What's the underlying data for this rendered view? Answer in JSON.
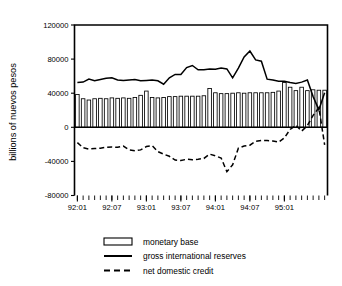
{
  "chart_data": {
    "type": "bar",
    "title": "",
    "xlabel": "",
    "ylabel": "billions of nuevos pesos",
    "ylim": [
      -80000,
      120000
    ],
    "yticks": [
      -80000,
      -40000,
      0,
      40000,
      80000,
      120000
    ],
    "ytick_labels": [
      "-80000",
      "-40000",
      "0",
      "40000",
      "80000",
      "120000"
    ],
    "grid": false,
    "legend_position": "below",
    "x_frequency": "monthly",
    "x": [
      "92:01",
      "92:02",
      "92:03",
      "92:04",
      "92:05",
      "92:06",
      "92:07",
      "92:08",
      "92:09",
      "92:10",
      "92:11",
      "92:12",
      "93:01",
      "93:02",
      "93:03",
      "93:04",
      "93:05",
      "93:06",
      "93:07",
      "93:08",
      "93:09",
      "93:10",
      "93:11",
      "93:12",
      "94:01",
      "94:02",
      "94:03",
      "94:04",
      "94:05",
      "94:06",
      "94:07",
      "94:08",
      "94:09",
      "94:10",
      "94:11",
      "94:12",
      "95:01",
      "95:02",
      "95:03",
      "95:04",
      "95:05",
      "95:06",
      "95:07",
      "95:08"
    ],
    "xtick_labels": [
      "92:01",
      "92:07",
      "93:01",
      "93:07",
      "94:01",
      "94:07",
      "95:01"
    ],
    "xtick_positions": [
      0,
      6,
      12,
      18,
      24,
      30,
      36
    ],
    "series": [
      {
        "name": "monetary base",
        "style": "bar",
        "values": [
          38500,
          33500,
          32000,
          33500,
          34000,
          33500,
          34500,
          34000,
          34500,
          34000,
          35000,
          37500,
          42500,
          35000,
          34500,
          35000,
          36000,
          36000,
          36500,
          36500,
          36500,
          36500,
          37000,
          45500,
          40500,
          39500,
          39500,
          40000,
          40500,
          40000,
          40500,
          40500,
          40500,
          40500,
          41000,
          42500,
          52500,
          47000,
          43000,
          47000,
          43000,
          44000,
          43500,
          43500
        ]
      },
      {
        "name": "gross international reserves",
        "style": "solid-line",
        "values": [
          52500,
          53000,
          56500,
          54500,
          56000,
          57500,
          58000,
          55500,
          55000,
          55500,
          56000,
          54500,
          55000,
          55500,
          54500,
          50500,
          58000,
          62000,
          62000,
          70000,
          72500,
          67500,
          67500,
          68500,
          68000,
          69500,
          68500,
          58000,
          69500,
          82500,
          89500,
          79000,
          77500,
          56500,
          55500,
          54000,
          54000,
          52500,
          51500,
          53000,
          55500,
          36000,
          20500,
          40500
        ]
      },
      {
        "name": "net domestic credit",
        "style": "dashed-line",
        "values": [
          -18000,
          -24000,
          -25500,
          -25000,
          -24500,
          -23500,
          -23000,
          -23500,
          -22000,
          -26500,
          -27500,
          -26500,
          -22500,
          -21500,
          -28500,
          -31500,
          -34000,
          -38500,
          -39000,
          -37500,
          -38000,
          -37500,
          -36500,
          -31500,
          -33500,
          -36000,
          -52000,
          -44000,
          -24500,
          -22000,
          -21000,
          -16500,
          -15500,
          -15500,
          -16000,
          -17500,
          -12500,
          -2500,
          2500,
          -4500,
          2000,
          14000,
          23000,
          -20500
        ]
      }
    ],
    "legend": [
      {
        "label": "monetary base",
        "marker": "bar"
      },
      {
        "label": "gross international reserves",
        "marker": "solid-line"
      },
      {
        "label": "net domestic credit",
        "marker": "dashed-line"
      }
    ]
  }
}
